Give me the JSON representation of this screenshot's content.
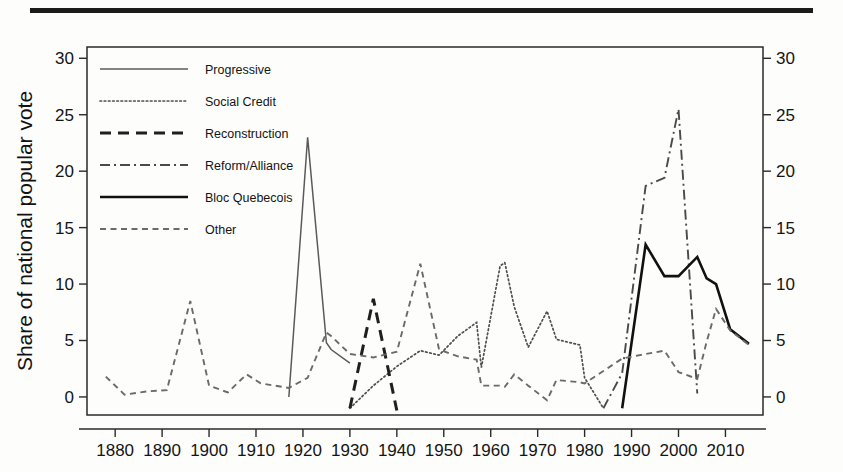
{
  "figure": {
    "title": "Third party share of the popular vote in Canada, 1878-2015",
    "title_visible": false
  },
  "axes": {
    "ylabel": "Share of national popular vote",
    "xlabel": "",
    "y_ticks": [
      "0",
      "5",
      "10",
      "15",
      "20",
      "25",
      "30"
    ],
    "y_ticks_right": [
      "0",
      "5",
      "10",
      "15",
      "20",
      "25",
      "30"
    ],
    "x_ticks": [
      "1880",
      "1890",
      "1900",
      "1910",
      "1920",
      "1930",
      "1940",
      "1950",
      "1960",
      "1970",
      "1980",
      "1990",
      "2000",
      "2010"
    ]
  },
  "legend": {
    "items": [
      {
        "label": "Progressive",
        "style": "solid-thin",
        "color": "#5a5a5a"
      },
      {
        "label": "Social Credit",
        "style": "dotted",
        "color": "#4f4f4f"
      },
      {
        "label": "Reconstruction",
        "style": "long-dash",
        "color": "#1f1f1f"
      },
      {
        "label": "Reform/Alliance",
        "style": "dash-dot",
        "color": "#4a4a4a"
      },
      {
        "label": "Bloc Quebecois",
        "style": "solid-thick",
        "color": "#111111"
      },
      {
        "label": "Other",
        "style": "short-dash",
        "color": "#6a6a6a"
      }
    ]
  },
  "chart_data": {
    "type": "line",
    "title": "Third party share of the popular vote in Canada, 1878-2015",
    "xlabel": "",
    "ylabel": "Share of national popular vote",
    "xlim": [
      1874,
      2018
    ],
    "ylim": [
      -1.6,
      31.0
    ],
    "grid": false,
    "legend_position": "upper-left-inside",
    "y_axis_right_mirror": true,
    "series": [
      {
        "name": "Progressive",
        "x": [
          1917,
          1921,
          1925,
          1926,
          1930
        ],
        "values": [
          0.0,
          23.0,
          4.8,
          4.2,
          3.0
        ]
      },
      {
        "name": "Social Credit",
        "x": [
          1930,
          1935,
          1940,
          1945,
          1949,
          1953,
          1957,
          1958,
          1962,
          1963,
          1965,
          1968,
          1972,
          1974,
          1979,
          1980,
          1984
        ],
        "values": [
          -1.0,
          1.0,
          2.7,
          4.1,
          3.7,
          5.4,
          6.6,
          2.6,
          11.6,
          11.9,
          8.0,
          4.4,
          7.6,
          5.1,
          4.6,
          1.7,
          -1.0
        ]
      },
      {
        "name": "Reconstruction",
        "x": [
          1930,
          1935,
          1940
        ],
        "values": [
          -1.0,
          8.7,
          -1.2
        ]
      },
      {
        "name": "Reform/Alliance",
        "x": [
          1984,
          1988,
          1993,
          1997,
          2000,
          2004
        ],
        "values": [
          -1.0,
          2.1,
          18.7,
          19.4,
          25.5,
          0.3
        ]
      },
      {
        "name": "Bloc Quebecois",
        "x": [
          1988,
          1993,
          1997,
          2000,
          2004,
          2006,
          2008,
          2011,
          2015
        ],
        "values": [
          -1.0,
          13.5,
          10.7,
          10.7,
          12.4,
          10.5,
          10.0,
          6.0,
          4.7
        ]
      },
      {
        "name": "Other",
        "x": [
          1878,
          1882,
          1887,
          1891,
          1896,
          1900,
          1904,
          1908,
          1911,
          1917,
          1921,
          1925,
          1926,
          1930,
          1935,
          1940,
          1945,
          1949,
          1953,
          1957,
          1958,
          1962,
          1963,
          1965,
          1968,
          1972,
          1974,
          1979,
          1980,
          1984,
          1988,
          1993,
          1997,
          2000,
          2004,
          2006,
          2008,
          2011,
          2015
        ],
        "values": [
          1.8,
          0.2,
          0.5,
          0.6,
          8.5,
          1.0,
          0.4,
          2.0,
          1.2,
          0.8,
          1.7,
          5.7,
          5.4,
          3.8,
          3.5,
          4.0,
          11.8,
          4.2,
          3.6,
          3.3,
          1.0,
          1.0,
          0.9,
          2.0,
          1.0,
          -0.3,
          1.5,
          1.3,
          1.2,
          2.3,
          3.4,
          3.8,
          4.1,
          2.2,
          1.6,
          4.9,
          7.8,
          5.9,
          4.6
        ]
      }
    ]
  }
}
